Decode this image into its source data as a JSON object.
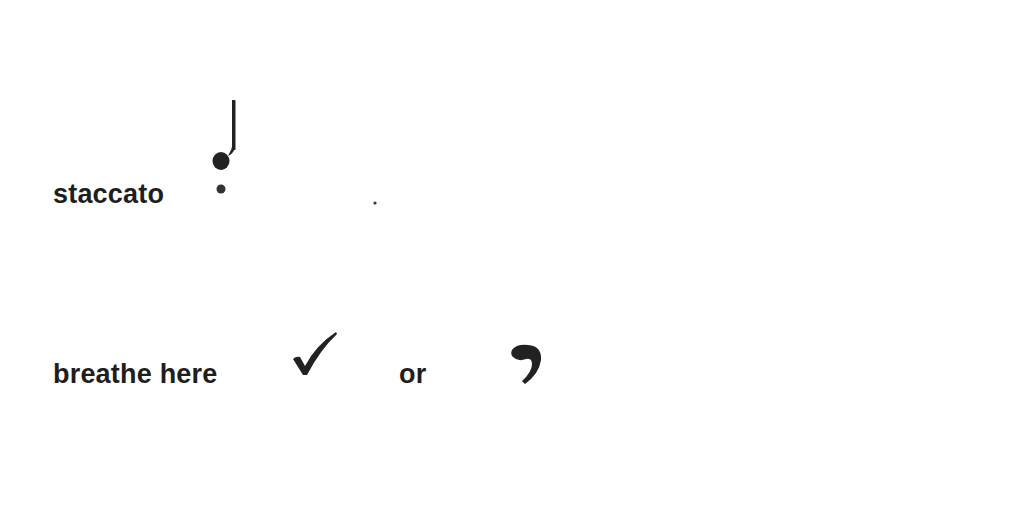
{
  "entries": [
    {
      "term": "staccato",
      "symbols": [
        {
          "name": "staccato-quarter-note-icon",
          "description": "quarter note with dot below"
        },
        {
          "name": "staccato-dot-icon",
          "description": "small dot"
        }
      ]
    },
    {
      "term": "breathe here",
      "connector": "or",
      "symbols": [
        {
          "name": "checkmark-breath-mark-icon",
          "description": "tick / check mark"
        },
        {
          "name": "comma-breath-mark-icon",
          "description": "comma breath mark"
        }
      ]
    }
  ],
  "colors": {
    "text": "#1e1e1e",
    "ink": "#222222",
    "background": "#ffffff"
  }
}
